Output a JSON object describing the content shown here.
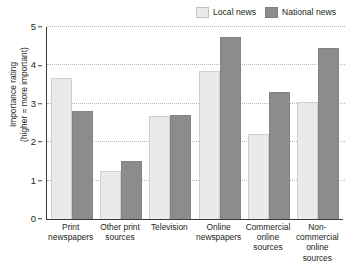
{
  "chart_data": {
    "type": "bar",
    "title": "",
    "xlabel": "",
    "ylabel": "Importance rating\n(higher = more important)",
    "ylim": [
      0,
      5
    ],
    "yticks": [
      0,
      1,
      2,
      3,
      4,
      5
    ],
    "grid": true,
    "legend_position": "top-right",
    "categories": [
      "Print\nnewspapers",
      "Other print\nsources",
      "Television",
      "Online\nnewspapers",
      "Commercial\nonline sources",
      "Non-commercial\nonline sources"
    ],
    "series": [
      {
        "name": "Local news",
        "color": "#e9eaea",
        "values": [
          3.68,
          1.25,
          2.69,
          3.86,
          2.22,
          3.06
        ]
      },
      {
        "name": "National news",
        "color": "#8b8c8c",
        "values": [
          2.82,
          1.51,
          2.7,
          4.74,
          3.32,
          4.45
        ]
      }
    ]
  },
  "legend": {
    "items": [
      {
        "label": "Local news"
      },
      {
        "label": "National news"
      }
    ]
  },
  "axis": {
    "y": {
      "label_line1": "Importance rating",
      "label_line2": "(higher = more important)",
      "ticks": [
        "5",
        "4",
        "3",
        "2",
        "1",
        "0"
      ]
    }
  }
}
